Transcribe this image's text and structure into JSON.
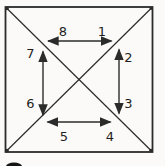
{
  "colors": {
    "background": "#fbfaf8",
    "line": "#2b2b2b",
    "text": "#1e1e1e"
  },
  "diagram": {
    "shape": "square-with-diagonals",
    "arrows": [
      {
        "id": "top-horizontal",
        "direction": "horizontal",
        "labels": [
          "8",
          "1"
        ]
      },
      {
        "id": "right-vertical",
        "direction": "vertical",
        "labels": [
          "2",
          "3"
        ]
      },
      {
        "id": "left-vertical",
        "direction": "vertical",
        "labels": [
          "7",
          "6"
        ]
      },
      {
        "id": "bottom-horizontal",
        "direction": "horizontal",
        "labels": [
          "5",
          "4"
        ]
      }
    ]
  }
}
